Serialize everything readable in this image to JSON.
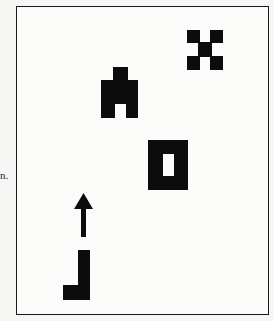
{
  "edge_text": "n.",
  "figure": {
    "colors": {
      "shape": "#0c0c0c",
      "background": "#fbfbfa",
      "border": "#1a1a1a"
    },
    "shapes": [
      {
        "name": "x-cross",
        "bbox": [
          187,
          30,
          223,
          70
        ]
      },
      {
        "name": "robot-figure",
        "bbox": [
          101,
          67,
          138,
          118
        ]
      },
      {
        "name": "hollow-rectangle",
        "bbox": [
          148,
          140,
          188,
          190
        ]
      },
      {
        "name": "up-arrow",
        "bbox": [
          74,
          193,
          93,
          237
        ]
      },
      {
        "name": "l-shape",
        "bbox": [
          63,
          250,
          90,
          300
        ]
      }
    ]
  }
}
